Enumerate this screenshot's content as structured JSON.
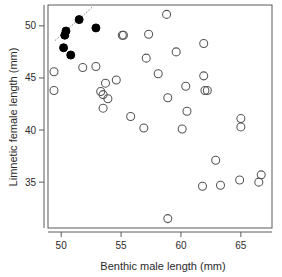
{
  "chart_data": {
    "type": "scatter",
    "title": "",
    "xlabel": "Benthic male length (mm)",
    "ylabel": "Limnetic female length (mm)",
    "xlim": [
      48.9,
      67.6
    ],
    "ylim": [
      30.6,
      52.0
    ],
    "xticks": [
      50,
      55,
      60,
      65
    ],
    "yticks": [
      35,
      40,
      45,
      50
    ],
    "xtick_labels": [
      "50",
      "55",
      "60",
      "65"
    ],
    "ytick_labels": [
      "35",
      "40",
      "45",
      "50"
    ],
    "grid": false,
    "legend": null,
    "legend_position": "none",
    "frame": true,
    "series": [
      {
        "name": "filled",
        "marker": "circle-filled",
        "color": "#000000",
        "points": [
          [
            50.2,
            47.9
          ],
          [
            50.3,
            49.1
          ],
          [
            50.4,
            49.5
          ],
          [
            50.8,
            47.2
          ],
          [
            51.5,
            50.6
          ],
          [
            52.9,
            49.8
          ]
        ]
      },
      {
        "name": "open",
        "marker": "circle-open",
        "color": "#555555",
        "points": [
          [
            49.4,
            45.6
          ],
          [
            49.4,
            43.8
          ],
          [
            51.8,
            46.0
          ],
          [
            52.9,
            46.1
          ],
          [
            53.3,
            43.7
          ],
          [
            53.5,
            43.4
          ],
          [
            53.5,
            42.1
          ],
          [
            53.7,
            44.5
          ],
          [
            53.9,
            43.0
          ],
          [
            54.6,
            44.8
          ],
          [
            55.1,
            49.1
          ],
          [
            55.2,
            49.1
          ],
          [
            55.8,
            41.3
          ],
          [
            56.9,
            40.2
          ],
          [
            57.1,
            46.9
          ],
          [
            57.3,
            49.2
          ],
          [
            58.1,
            45.4
          ],
          [
            58.8,
            51.1
          ],
          [
            58.9,
            31.5
          ],
          [
            58.9,
            43.1
          ],
          [
            59.6,
            47.5
          ],
          [
            60.1,
            40.1
          ],
          [
            60.4,
            44.2
          ],
          [
            60.5,
            41.8
          ],
          [
            61.8,
            34.6
          ],
          [
            61.9,
            48.3
          ],
          [
            61.9,
            45.2
          ],
          [
            62.0,
            43.8
          ],
          [
            62.2,
            43.8
          ],
          [
            62.9,
            37.1
          ],
          [
            63.3,
            34.7
          ],
          [
            64.9,
            35.2
          ],
          [
            65.0,
            41.1
          ],
          [
            65.0,
            40.3
          ],
          [
            66.5,
            35.0
          ],
          [
            66.7,
            35.7
          ]
        ]
      }
    ],
    "annotations": [
      {
        "type": "line",
        "style": "dotted",
        "color": "#777777",
        "from": [
          49.5,
          48.6
        ],
        "to": [
          52.6,
          51.8
        ]
      }
    ]
  }
}
